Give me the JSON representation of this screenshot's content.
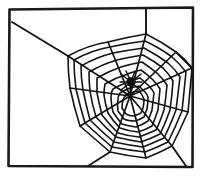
{
  "artwork": {
    "title": "Spider web in a frame",
    "subject": "spider-on-web",
    "style": "black-and-white line drawing",
    "background_color": "#ffffff",
    "ink_color": "#141414"
  },
  "frame": {
    "name": "picture-frame-border",
    "color": "#1a1a1a",
    "stroke_width": 2.6,
    "points": [
      [
        9,
        9
      ],
      [
        193,
        7
      ],
      [
        193,
        167
      ],
      [
        8,
        166
      ]
    ]
  },
  "web": {
    "hub": {
      "x": 130,
      "y": 96
    },
    "anchor_points": [
      {
        "name": "anchor-top-left-edge",
        "x": 14,
        "y": 23
      },
      {
        "name": "anchor-top-edge",
        "x": 146,
        "y": 9
      },
      {
        "name": "anchor-right-edge",
        "x": 192,
        "y": 68
      },
      {
        "name": "anchor-bottom-right",
        "x": 186,
        "y": 166
      },
      {
        "name": "anchor-bottom-left",
        "x": 88,
        "y": 166
      }
    ],
    "bridge_thread": {
      "from": [
        14,
        23
      ],
      "to": [
        68,
        56
      ]
    },
    "outer_nodes": [
      [
        68,
        56
      ],
      [
        110,
        41
      ],
      [
        146,
        34
      ],
      [
        176,
        52
      ],
      [
        192,
        68
      ],
      [
        186,
        110
      ],
      [
        172,
        146
      ],
      [
        130,
        158
      ],
      [
        96,
        150
      ],
      [
        77,
        122
      ],
      [
        70,
        88
      ]
    ],
    "radial_count": 11,
    "spiral_ring_count": 9,
    "spiral_rings": [
      {
        "index": 1,
        "scale": 0.93
      },
      {
        "index": 2,
        "scale": 0.83
      },
      {
        "index": 3,
        "scale": 0.73
      },
      {
        "index": 4,
        "scale": 0.63
      },
      {
        "index": 5,
        "scale": 0.53
      },
      {
        "index": 6,
        "scale": 0.43
      },
      {
        "index": 7,
        "scale": 0.33
      },
      {
        "index": 8,
        "scale": 0.23
      },
      {
        "index": 9,
        "scale": 0.14
      }
    ]
  },
  "spider": {
    "name": "spider",
    "x": 131,
    "y": 82,
    "body_radius": 4.2,
    "leg_count": 8,
    "color": "#111111"
  }
}
